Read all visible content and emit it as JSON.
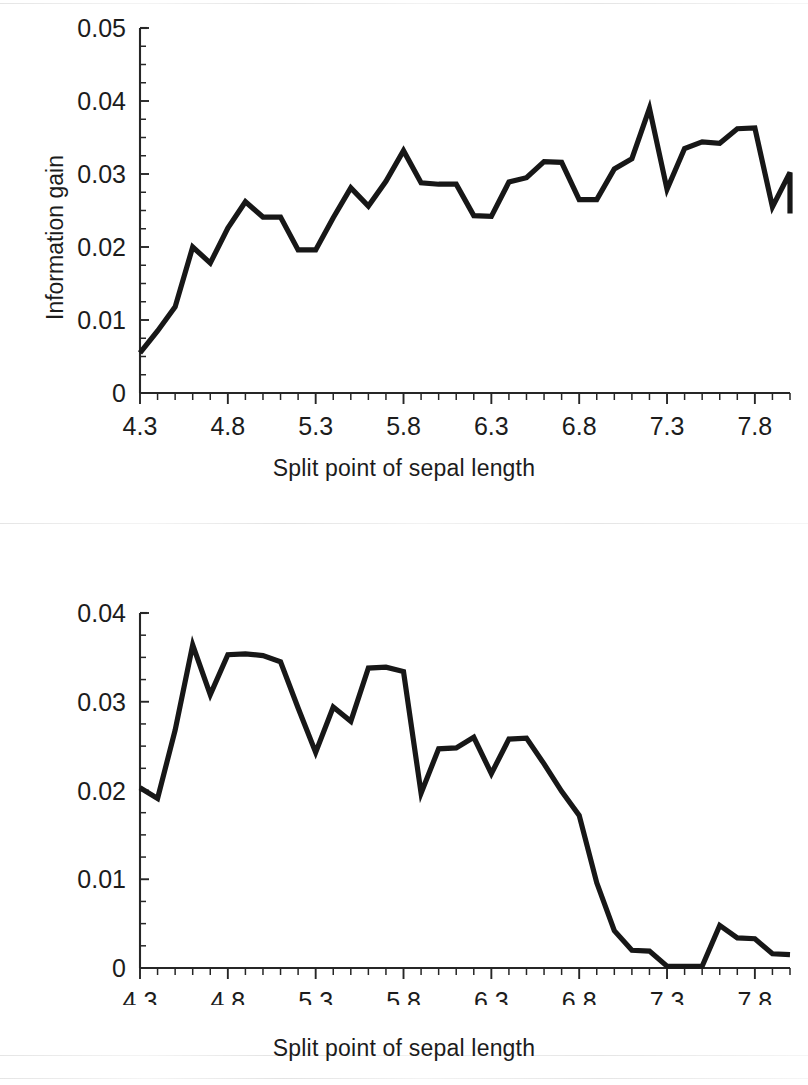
{
  "figure": {
    "background_color": "#ffffff",
    "line_color": "#171717",
    "axis_color": "#262626",
    "text_color": "#1c1c1c"
  },
  "panels": [
    {
      "id": "top",
      "x_axis_title": "Split point of sepal length",
      "y_axis_title": "Information gain",
      "y_ticks": [
        "0",
        "0.01",
        "0.02",
        "0.03",
        "0.04",
        "0.05"
      ],
      "x_ticks": [
        "4.3",
        "4.8",
        "5.3",
        "5.8",
        "6.3",
        "6.8",
        "7.3",
        "7.8"
      ]
    },
    {
      "id": "bottom",
      "x_axis_title": "Split point of sepal length",
      "y_axis_title": "Information gain",
      "y_ticks": [
        "0",
        "0.01",
        "0.02",
        "0.03",
        "0.04"
      ],
      "x_ticks": [
        "4.3",
        "4.8",
        "5.3",
        "5.8",
        "6.3",
        "6.8",
        "7.3",
        "7.8"
      ]
    }
  ],
  "chart_data": [
    {
      "type": "line",
      "panel": "top",
      "title": "",
      "xlabel": "Split point of sepal length",
      "ylabel": "Information gain",
      "xlim": [
        4.3,
        8.0
      ],
      "ylim": [
        0,
        0.05
      ],
      "ytick_values": [
        0,
        0.01,
        0.02,
        0.03,
        0.04,
        0.05
      ],
      "ytick_labels": [
        "0",
        "0.01",
        "0.02",
        "0.03",
        "0.04",
        "0.05"
      ],
      "xtick_labels": [
        "4.3",
        "4.8",
        "5.3",
        "5.8",
        "6.3",
        "6.8",
        "7.3",
        "7.8"
      ],
      "xtick_major_values": [
        4.3,
        4.8,
        5.3,
        5.8,
        6.3,
        6.8,
        7.3,
        7.8
      ],
      "minor_tick_interval_x": 0.1,
      "minor_tick_interval_y": 0.0025,
      "grid": false,
      "legend": null,
      "x": [
        4.3,
        4.4,
        4.5,
        4.6,
        4.7,
        4.8,
        4.9,
        5.0,
        5.1,
        5.2,
        5.3,
        5.4,
        5.5,
        5.6,
        5.7,
        5.8,
        5.9,
        6.0,
        6.1,
        6.2,
        6.3,
        6.4,
        6.5,
        6.6,
        6.7,
        6.8,
        6.9,
        7.0,
        7.1,
        7.2,
        7.3,
        7.4,
        7.5,
        7.6,
        7.7,
        7.8,
        7.9,
        8.0
      ],
      "values": [
        0.0055,
        0.0085,
        0.0118,
        0.02,
        0.0178,
        0.0226,
        0.0262,
        0.0241,
        0.0241,
        0.0196,
        0.0196,
        0.024,
        0.0281,
        0.0256,
        0.029,
        0.0332,
        0.0288,
        0.0286,
        0.0286,
        0.0243,
        0.0242,
        0.0289,
        0.0295,
        0.0317,
        0.0316,
        0.0265,
        0.0265,
        0.0307,
        0.0321,
        0.039,
        0.0279,
        0.0335,
        0.0344,
        0.0342,
        0.0362,
        0.0363,
        0.0255,
        0.0302,
        0.0246
      ],
      "series": [
        {
          "name": "Information gain",
          "values": [
            0.0055,
            0.0085,
            0.0118,
            0.02,
            0.0178,
            0.0226,
            0.0262,
            0.0241,
            0.0241,
            0.0196,
            0.0196,
            0.024,
            0.0281,
            0.0256,
            0.029,
            0.0332,
            0.0288,
            0.0286,
            0.0286,
            0.0243,
            0.0242,
            0.0289,
            0.0295,
            0.0317,
            0.0316,
            0.0265,
            0.0265,
            0.0307,
            0.0321,
            0.039,
            0.0279,
            0.0335,
            0.0344,
            0.0342,
            0.0362,
            0.0363,
            0.0255,
            0.0302,
            0.0246
          ]
        }
      ]
    },
    {
      "type": "line",
      "panel": "bottom",
      "title": "",
      "xlabel": "Split point of sepal length",
      "ylabel": "Information gain",
      "xlim": [
        4.3,
        8.0
      ],
      "ylim": [
        0,
        0.04
      ],
      "ytick_values": [
        0,
        0.01,
        0.02,
        0.03,
        0.04
      ],
      "ytick_labels": [
        "0",
        "0.01",
        "0.02",
        "0.03",
        "0.04"
      ],
      "xtick_labels": [
        "4.3",
        "4.8",
        "5.3",
        "5.8",
        "6.3",
        "6.8",
        "7.3",
        "7.8"
      ],
      "xtick_major_values": [
        4.3,
        4.8,
        5.3,
        5.8,
        6.3,
        6.8,
        7.3,
        7.8
      ],
      "minor_tick_interval_x": 0.1,
      "minor_tick_interval_y": 0.0025,
      "grid": false,
      "legend": null,
      "x": [
        4.3,
        4.4,
        4.5,
        4.6,
        4.7,
        4.8,
        4.9,
        5.0,
        5.1,
        5.2,
        5.3,
        5.4,
        5.5,
        5.6,
        5.7,
        5.8,
        5.9,
        6.0,
        6.1,
        6.2,
        6.3,
        6.4,
        6.5,
        6.6,
        6.7,
        6.8,
        6.9,
        7.0,
        7.1,
        7.2,
        7.3,
        7.4,
        7.5,
        7.6,
        7.7,
        7.8,
        7.9,
        8.0
      ],
      "values": [
        0.0203,
        0.0191,
        0.0268,
        0.0364,
        0.0308,
        0.0353,
        0.0354,
        0.0352,
        0.0345,
        0.0293,
        0.0243,
        0.0294,
        0.0278,
        0.0338,
        0.0339,
        0.0334,
        0.0197,
        0.0247,
        0.0248,
        0.026,
        0.0219,
        0.0258,
        0.0259,
        0.023,
        0.0199,
        0.0172,
        0.0096,
        0.0042,
        0.002,
        0.0019,
        0.0002,
        0.0002,
        0.0002,
        0.0048,
        0.0034,
        0.0033,
        0.0016,
        0.0015
      ],
      "series": [
        {
          "name": "Information gain",
          "values": [
            0.0203,
            0.0191,
            0.0268,
            0.0364,
            0.0308,
            0.0353,
            0.0354,
            0.0352,
            0.0345,
            0.0293,
            0.0243,
            0.0294,
            0.0278,
            0.0338,
            0.0339,
            0.0334,
            0.0197,
            0.0247,
            0.0248,
            0.026,
            0.0219,
            0.0258,
            0.0259,
            0.023,
            0.0199,
            0.0172,
            0.0096,
            0.0042,
            0.002,
            0.0019,
            0.0002,
            0.0002,
            0.0002,
            0.0048,
            0.0034,
            0.0033,
            0.0016,
            0.0015
          ]
        }
      ]
    }
  ]
}
